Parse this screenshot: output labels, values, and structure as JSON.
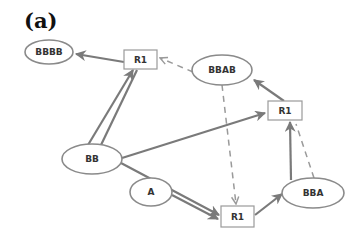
{
  "panel_label": "(a)",
  "colors": {
    "edge_solid": "#7a7a7a",
    "edge_dashed": "#9a9a9a",
    "node_stroke": "#8a8a8a",
    "text": "#333333"
  },
  "nodes": [
    {
      "id": "BBBB",
      "label": "BBBB",
      "shape": "ellipse"
    },
    {
      "id": "R1_top",
      "label": "R1",
      "shape": "rect"
    },
    {
      "id": "BBAB",
      "label": "BBAB",
      "shape": "ellipse"
    },
    {
      "id": "R1_right",
      "label": "R1",
      "shape": "rect"
    },
    {
      "id": "BB",
      "label": "BB",
      "shape": "ellipse"
    },
    {
      "id": "A",
      "label": "A",
      "shape": "ellipse"
    },
    {
      "id": "R1_bottom",
      "label": "R1",
      "shape": "rect"
    },
    {
      "id": "BBA",
      "label": "BBA",
      "shape": "ellipse"
    }
  ],
  "edges": [
    {
      "from": "R1_top",
      "to": "BBBB",
      "style": "solid"
    },
    {
      "from": "BB",
      "to": "R1_top",
      "style": "solid"
    },
    {
      "from": "BB",
      "to": "R1_top",
      "style": "solid"
    },
    {
      "from": "BBAB",
      "to": "R1_top",
      "style": "dashed"
    },
    {
      "from": "R1_right",
      "to": "BBAB",
      "style": "solid"
    },
    {
      "from": "BB",
      "to": "R1_right",
      "style": "solid"
    },
    {
      "from": "BB",
      "to": "R1_bottom",
      "style": "solid"
    },
    {
      "from": "A",
      "to": "R1_bottom",
      "style": "solid"
    },
    {
      "from": "BBAB",
      "to": "R1_bottom",
      "style": "dashed"
    },
    {
      "from": "R1_bottom",
      "to": "BBA",
      "style": "solid"
    },
    {
      "from": "BBA",
      "to": "R1_right",
      "style": "solid"
    },
    {
      "from": "BBA",
      "to": "R1_right",
      "style": "dashed"
    }
  ]
}
